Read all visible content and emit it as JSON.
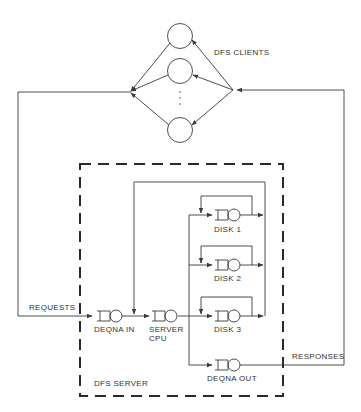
{
  "diagram": {
    "type": "queueing-network",
    "clients": {
      "label": "DFS CLIENTS",
      "count_shown": 3,
      "ellipsis": "⋮"
    },
    "server": {
      "label": "DFS SERVER",
      "boundary_style": "dashed"
    },
    "flows": {
      "requests": "REQUESTS",
      "responses": "RESPONSES"
    },
    "queues": [
      {
        "id": "deqna-in",
        "label": "DEQNA IN"
      },
      {
        "id": "server-cpu",
        "label_line1": "SERVER",
        "label_line2": "CPU"
      },
      {
        "id": "disk-1",
        "label": "DISK 1"
      },
      {
        "id": "disk-2",
        "label": "DISK 2"
      },
      {
        "id": "disk-3",
        "label": "DISK 3"
      },
      {
        "id": "deqna-out",
        "label": "DEQNA OUT"
      }
    ],
    "colors": {
      "line": "#3a3a3a",
      "text": "#333333",
      "background": "#ffffff"
    }
  }
}
